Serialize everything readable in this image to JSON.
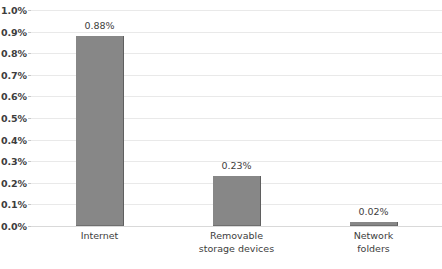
{
  "chart_data": {
    "type": "bar",
    "title": "",
    "xlabel": "",
    "ylabel": "",
    "categories": [
      "Internet",
      "Removable storage devices",
      "Network folders"
    ],
    "category_lines": [
      [
        "Internet"
      ],
      [
        "Removable",
        "storage devices"
      ],
      [
        "Network",
        "folders"
      ]
    ],
    "values": [
      0.88,
      0.23,
      0.02
    ],
    "value_labels": [
      "0.88%",
      "0.23%",
      "0.02%"
    ],
    "ylim": [
      0.0,
      1.0
    ],
    "y_tick_values": [
      0.0,
      0.1,
      0.2,
      0.3,
      0.4,
      0.5,
      0.6,
      0.7,
      0.8,
      0.9,
      1.0
    ],
    "y_tick_labels": [
      "0.0%",
      "0.1%",
      "0.2%",
      "0.3%",
      "0.4%",
      "0.5%",
      "0.6%",
      "0.7%",
      "0.8%",
      "0.9%",
      "1.0%"
    ],
    "grid": true,
    "legend": false,
    "colors": {
      "bar": "#878787",
      "bar_edge": "#5f5f5f",
      "gridline": "#e9e9e9",
      "baseline": "#d9d9d9",
      "text": "#3d3d3d",
      "background": "#ffffff"
    }
  }
}
